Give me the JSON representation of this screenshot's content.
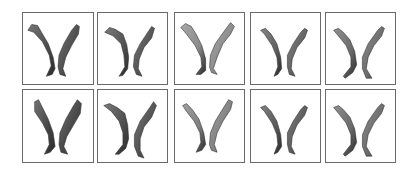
{
  "figure": {
    "rows": 2,
    "columns": 5,
    "frame_color": "#6a6a6a",
    "background": "#ffffff",
    "panels": [
      {
        "id": "r1c1",
        "tone": "#4a4a4a",
        "shape": "v-left-hooked"
      },
      {
        "id": "r1c2",
        "tone": "#505050",
        "shape": "v-left-angled"
      },
      {
        "id": "r1c3",
        "tone": "#8a8a8a",
        "shape": "v-wide-light"
      },
      {
        "id": "r1c4",
        "tone": "#5e5e5e",
        "shape": "v-curved"
      },
      {
        "id": "r1c5",
        "tone": "#6a6a6a",
        "shape": "v-splayed"
      },
      {
        "id": "r2c1",
        "tone": "#444444",
        "shape": "v-broad"
      },
      {
        "id": "r2c2",
        "tone": "#4e4e4e",
        "shape": "v-offset"
      },
      {
        "id": "r2c3",
        "tone": "#808080",
        "shape": "v-light"
      },
      {
        "id": "r2c4",
        "tone": "#585858",
        "shape": "v-curved"
      },
      {
        "id": "r2c5",
        "tone": "#6a6a6a",
        "shape": "v-splayed"
      }
    ]
  }
}
